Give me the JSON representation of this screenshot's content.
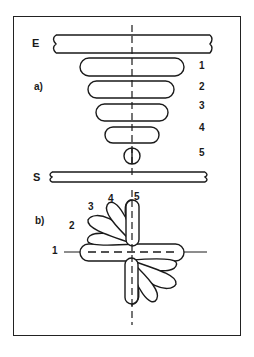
{
  "diagram": {
    "plates": {
      "top": "E",
      "bottom": "S"
    },
    "part_a": {
      "label": "a)",
      "steps": [
        "1",
        "2",
        "3",
        "4",
        "5"
      ]
    },
    "part_b": {
      "label": "b)",
      "steps": [
        "1",
        "2",
        "3",
        "4",
        "5"
      ]
    },
    "colors": {
      "line": "#1a1a1a",
      "background": "#ffffff"
    }
  }
}
